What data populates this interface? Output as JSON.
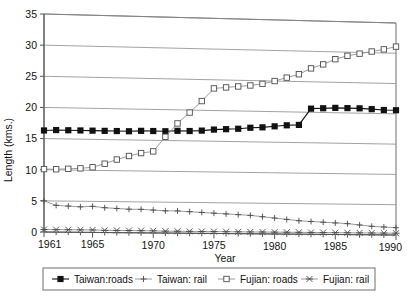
{
  "chart_data": {
    "type": "line",
    "title": "",
    "xlabel": "Year",
    "ylabel": "Length (kms.)",
    "xlim": [
      1961,
      1990
    ],
    "ylim": [
      0,
      35
    ],
    "grid": true,
    "legend_position": "bottom",
    "ytick_labels": [
      "0",
      "5",
      "10",
      "15",
      "20",
      "25",
      "30",
      "35"
    ],
    "yticks": [
      0,
      5,
      10,
      15,
      20,
      25,
      30,
      35
    ],
    "xtick_labels": [
      "1961",
      "1965",
      "1970",
      "1975",
      "1980",
      "1985",
      "1990"
    ],
    "xticks": [
      1961,
      1965,
      1970,
      1975,
      1980,
      1985,
      1990
    ],
    "x": [
      1961,
      1962,
      1963,
      1964,
      1965,
      1966,
      1967,
      1968,
      1969,
      1970,
      1971,
      1972,
      1973,
      1974,
      1975,
      1976,
      1977,
      1978,
      1979,
      1980,
      1981,
      1982,
      1983,
      1984,
      1985,
      1986,
      1987,
      1988,
      1989,
      1990
    ],
    "series": [
      {
        "name": "Taiwan:roads",
        "marker": "filled-square",
        "values": [
          16.3,
          16.4,
          16.4,
          16.4,
          16.4,
          16.4,
          16.4,
          16.4,
          16.5,
          16.5,
          16.5,
          16.6,
          16.6,
          16.7,
          16.9,
          17.0,
          17.1,
          17.3,
          17.4,
          17.6,
          17.8,
          17.9,
          20.6,
          20.7,
          20.8,
          20.8,
          20.8,
          20.7,
          20.6,
          20.6
        ]
      },
      {
        "name": "Taiwan: rail",
        "marker": "plus",
        "values": [
          5.0,
          4.3,
          4.2,
          4.1,
          4.2,
          4.0,
          3.9,
          3.8,
          3.8,
          3.7,
          3.6,
          3.6,
          3.5,
          3.4,
          3.3,
          3.2,
          3.1,
          3.0,
          2.8,
          2.6,
          2.4,
          2.2,
          2.1,
          2.0,
          1.9,
          1.8,
          1.6,
          1.4,
          1.3,
          1.2
        ]
      },
      {
        "name": "Fujian: roads",
        "marker": "open-square",
        "values": [
          10.1,
          10.1,
          10.2,
          10.3,
          10.5,
          11.1,
          11.8,
          12.4,
          12.9,
          13.2,
          15.6,
          17.8,
          19.6,
          21.5,
          23.6,
          23.8,
          24.0,
          24.2,
          24.5,
          25.0,
          25.6,
          26.2,
          27.2,
          27.9,
          28.8,
          29.4,
          29.8,
          30.2,
          30.6,
          31.1
        ]
      },
      {
        "name": "Fujian: rail",
        "marker": "star",
        "values": [
          0.4,
          0.4,
          0.4,
          0.4,
          0.4,
          0.35,
          0.35,
          0.35,
          0.35,
          0.35,
          0.3,
          0.3,
          0.3,
          0.3,
          0.3,
          0.3,
          0.3,
          0.3,
          0.3,
          0.3,
          0.3,
          0.3,
          0.3,
          0.3,
          0.3,
          0.3,
          0.3,
          0.3,
          0.3,
          0.3
        ]
      }
    ]
  },
  "legend": {
    "entries": [
      {
        "label": "Taiwan:roads"
      },
      {
        "label": "Taiwan: rail"
      },
      {
        "label": "Fujian: roads"
      },
      {
        "label": "Fujian: rail"
      }
    ]
  }
}
